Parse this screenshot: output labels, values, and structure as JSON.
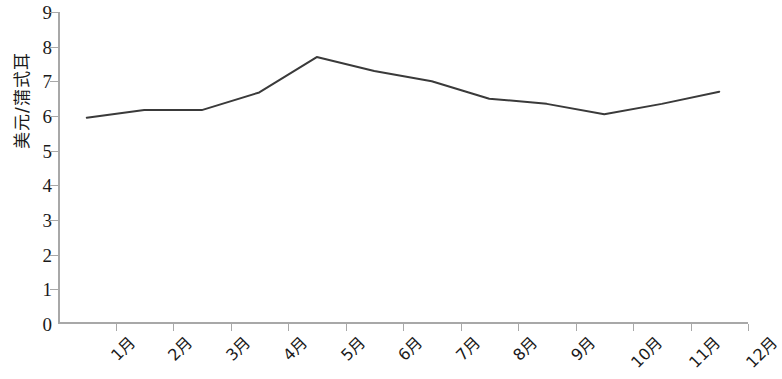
{
  "chart_data": {
    "type": "line",
    "title": "",
    "subtitle": "",
    "xlabel": "",
    "ylabel": "美元/蒲式耳",
    "categories": [
      "1月",
      "2月",
      "3月",
      "4月",
      "5月",
      "6月",
      "7月",
      "8月",
      "9月",
      "10月",
      "11月",
      "12月"
    ],
    "series": [
      {
        "name": "",
        "values": [
          5.95,
          6.17,
          6.17,
          6.68,
          7.7,
          7.3,
          7.0,
          6.5,
          6.35,
          6.05,
          6.35,
          6.7
        ]
      }
    ],
    "ylim": [
      0,
      9
    ],
    "y_ticks": [
      0,
      1,
      2,
      3,
      4,
      5,
      6,
      7,
      8,
      9
    ],
    "y_tick_labels": [
      "0",
      "1",
      "2",
      "3",
      "4",
      "5",
      "6",
      "7",
      "8",
      "9"
    ],
    "grid": false,
    "legend": false,
    "legend_position": "none",
    "markers": false,
    "line_color": "#3a3a3a",
    "line_width": 2,
    "axis_color": "#a8a8a8",
    "background_color": "#ffffff"
  }
}
